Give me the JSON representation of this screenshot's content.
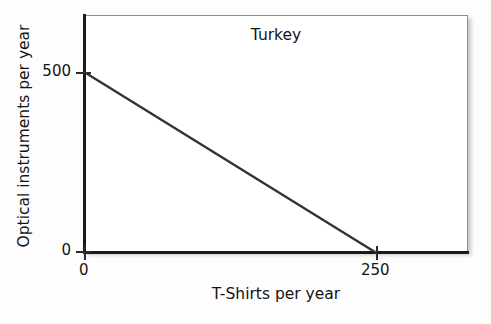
{
  "chart_data": {
    "type": "line",
    "title": "Turkey",
    "xlabel": "T-Shirts per year",
    "ylabel": "Optical instruments per year",
    "xlim": [
      0,
      330
    ],
    "ylim": [
      0,
      660
    ],
    "xticks": [
      0,
      250
    ],
    "xticklabels": [
      "0",
      "250"
    ],
    "yticks": [
      0,
      500
    ],
    "yticklabels": [
      "0",
      "500"
    ],
    "grid": false,
    "legend": null,
    "series": [
      {
        "name": "production possibilities frontier",
        "x": [
          0,
          250
        ],
        "y": [
          500,
          0
        ],
        "color": "#333333"
      }
    ],
    "annotations": [
      {
        "text": "Turkey",
        "position": "top-center-inside-plot"
      }
    ]
  },
  "labels": {
    "title": "Turkey",
    "x_axis_title": "T-Shirts per year",
    "y_axis_title": "Optical instruments per year",
    "y_tick_500": "500",
    "y_tick_0": "0",
    "x_tick_0": "0",
    "x_tick_250": "250"
  },
  "colors": {
    "line": "#333333",
    "axis": "#1a1a1a",
    "frame": "#8c8c8c",
    "text": "#141414",
    "background": "#fdfdfd",
    "plot_background": "#ffffff"
  }
}
